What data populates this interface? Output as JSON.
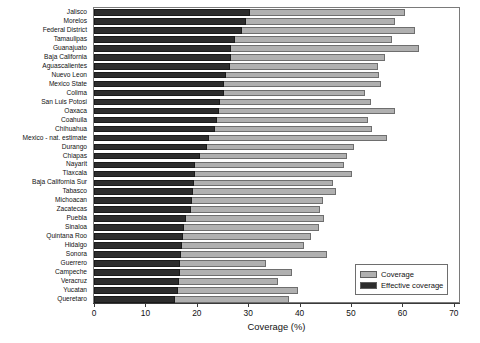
{
  "chart_data": {
    "type": "bar",
    "orientation": "horizontal",
    "title": "",
    "xlabel": "Coverage (%)",
    "ylabel": "",
    "xlim": [
      0,
      71
    ],
    "xticks": [
      0,
      10,
      20,
      30,
      40,
      50,
      60,
      70
    ],
    "grid": false,
    "legend_position": "lower right",
    "categories": [
      "Jalisco",
      "Morelos",
      "Federal District",
      "Tamaulipas",
      "Guanajuato",
      "Baja California",
      "Aguascalientes",
      "Nuevo Leon",
      "Mexico State",
      "Colima",
      "San Luis Potosi",
      "Oaxaca",
      "Coahuila",
      "Chihuahua",
      "Mexico - nat. estimate",
      "Durango",
      "Chiapas",
      "Nayarit",
      "Tlaxcala",
      "Baja California Sur",
      "Tabasco",
      "Michoacan",
      "Zacatecas",
      "Puebla",
      "Sinaloa",
      "Quintana Roo",
      "Hidalgo",
      "Sonora",
      "Guerrero",
      "Campeche",
      "Veracruz",
      "Yucatan",
      "Queretaro"
    ],
    "series": [
      {
        "name": "Coverage",
        "color": "#b0b0b0",
        "values": [
          60.5,
          58.6,
          62.4,
          58.0,
          63.2,
          56.6,
          55.2,
          55.5,
          55.9,
          52.7,
          53.8,
          58.6,
          53.3,
          54.1,
          57.0,
          50.6,
          49.3,
          48.7,
          50.2,
          46.4,
          47.0,
          44.6,
          44.0,
          44.8,
          43.7,
          42.2,
          40.9,
          45.4,
          33.4,
          38.6,
          35.7,
          39.6,
          38.0
        ]
      },
      {
        "name": "Effective coverage",
        "color": "#2d2d2d",
        "values": [
          30.3,
          29.5,
          28.7,
          27.5,
          26.6,
          26.6,
          26.4,
          25.6,
          25.2,
          25.2,
          24.6,
          24.4,
          24.0,
          23.5,
          22.3,
          21.9,
          20.6,
          19.6,
          19.6,
          19.4,
          19.2,
          19.0,
          18.8,
          17.8,
          17.6,
          17.3,
          17.1,
          17.0,
          16.8,
          16.7,
          16.5,
          16.3,
          15.7
        ]
      }
    ]
  },
  "legend": {
    "items": [
      {
        "label": "Coverage",
        "color": "#b0b0b0"
      },
      {
        "label": "Effective coverage",
        "color": "#2d2d2d"
      }
    ]
  }
}
